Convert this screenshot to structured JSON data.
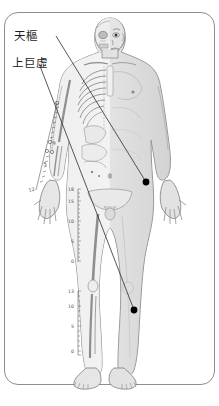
{
  "page": {
    "background": "#ffffff",
    "frame_color": "#8e8e8e"
  },
  "labels": [
    {
      "id": "tianshu",
      "text": "天樞",
      "x": 14,
      "y": 31
    },
    {
      "id": "shangjuxu",
      "text": "上巨虛",
      "x": 12,
      "y": 58
    }
  ],
  "acupoints": [
    {
      "id": "tianshu-point",
      "name": "天樞",
      "x": 146,
      "y": 182,
      "color": "#000000",
      "region": "abdomen"
    },
    {
      "id": "shangjuxu-point",
      "name": "上巨虛",
      "x": 134,
      "y": 310,
      "color": "#000000",
      "region": "lower-leg"
    }
  ],
  "leader_lines": [
    {
      "id": "leader-tianshu",
      "from": [
        56,
        36
      ],
      "to": [
        146,
        182
      ]
    },
    {
      "id": "leader-shangjuxu",
      "from": [
        40,
        66
      ],
      "to": [
        134,
        310
      ]
    }
  ],
  "figure": {
    "skin_color": "#e8e8e8",
    "bone_color": "#f4f4f4",
    "outline_color": "#6f6f6f",
    "shadow_color": "#c9c9c9"
  },
  "rulers": [
    {
      "id": "upper-ruler",
      "x": 78,
      "top": 189,
      "bottom": 262,
      "ticks": [
        18,
        15,
        10,
        5,
        0
      ],
      "labels": [
        "18",
        "15",
        "10",
        "5",
        "0"
      ]
    },
    {
      "id": "lower-ruler",
      "x": 78,
      "top": 291,
      "bottom": 355,
      "ticks": [
        13,
        10,
        5,
        0
      ],
      "labels": [
        "13",
        "10",
        "5",
        "0"
      ]
    }
  ],
  "arm_scale": {
    "id": "arm-scale",
    "labels": [
      "9",
      "5",
      "12"
    ],
    "positions": [
      [
        45,
        144
      ],
      [
        42,
        163
      ],
      [
        30,
        190
      ]
    ]
  },
  "colors": {
    "ink": "#1a1a1a",
    "line": "#3a3a3a",
    "frame": "#8e8e8e",
    "point": "#000000"
  }
}
